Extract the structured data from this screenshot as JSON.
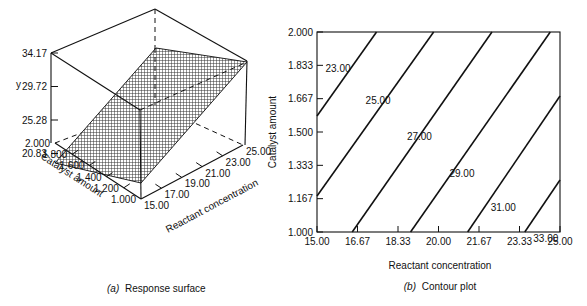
{
  "chart_data": [
    {
      "type": "surface3d",
      "caption_prefix": "(a)",
      "caption": "Response surface",
      "zlabel": "y",
      "xlabel": "Reactant concentration",
      "ylabel": "Catalyst amount",
      "z_ticks": [
        "34.17",
        "29.72",
        "25.28",
        "20.83"
      ],
      "y_ticks": [
        "2.000",
        "1.800",
        "1.600",
        "1.400",
        "1.200",
        "1.000"
      ],
      "x_ticks": [
        "15.00",
        "17.00",
        "19.00",
        "21.00",
        "23.00",
        "25.00"
      ],
      "zlim": [
        16.39,
        34.17
      ],
      "xlim": [
        15,
        25
      ],
      "ylim": [
        1.0,
        2.0
      ],
      "surface": {
        "model": "plane",
        "corners": [
          {
            "x": 15,
            "y": 2.0,
            "z": 21.5
          },
          {
            "x": 15,
            "y": 1.0,
            "z": 24.4
          },
          {
            "x": 25,
            "y": 1.0,
            "z": 35.0
          },
          {
            "x": 25,
            "y": 2.0,
            "z": 32.0
          }
        ]
      }
    },
    {
      "type": "contour",
      "caption_prefix": "(b)",
      "caption": "Contour plot",
      "xlabel": "Reactant concentration",
      "ylabel": "Catalyst amount",
      "x_ticks": [
        "15.00",
        "16.67",
        "18.33",
        "20.00",
        "21.67",
        "23.33",
        "25.00"
      ],
      "y_ticks": [
        "1.000",
        "1.167",
        "1.333",
        "1.500",
        "1.667",
        "1.833",
        "2.000"
      ],
      "xlim": [
        15,
        25
      ],
      "ylim": [
        1.0,
        2.0
      ],
      "contours": [
        {
          "level": "23.00",
          "x1": 15.0,
          "y1": 1.58,
          "x2": 17.45,
          "y2": 2.0
        },
        {
          "level": "25.00",
          "x1": 15.0,
          "y1": 1.18,
          "x2": 19.8,
          "y2": 2.0
        },
        {
          "level": "27.00",
          "x1": 16.45,
          "y1": 1.0,
          "x2": 22.2,
          "y2": 2.0
        },
        {
          "level": "29.00",
          "x1": 18.85,
          "y1": 1.0,
          "x2": 24.6,
          "y2": 2.0
        },
        {
          "level": "31.00",
          "x1": 21.2,
          "y1": 1.0,
          "x2": 25.0,
          "y2": 1.68
        },
        {
          "level": "33.00",
          "x1": 23.55,
          "y1": 1.0,
          "x2": 25.0,
          "y2": 1.26
        }
      ],
      "contour_label_positions": [
        {
          "level": "23.00",
          "x": 15.35,
          "y": 1.8
        },
        {
          "level": "25.00",
          "x": 17.0,
          "y": 1.64
        },
        {
          "level": "27.00",
          "x": 18.7,
          "y": 1.46
        },
        {
          "level": "29.00",
          "x": 20.45,
          "y": 1.275
        },
        {
          "level": "31.00",
          "x": 22.15,
          "y": 1.105
        },
        {
          "level": "33.00",
          "x": 23.9,
          "y": 0.95
        }
      ]
    }
  ]
}
